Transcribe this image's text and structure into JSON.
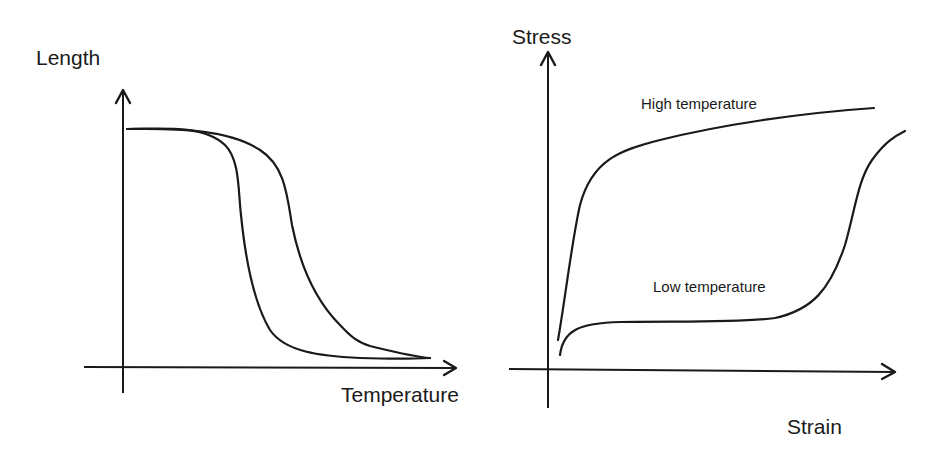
{
  "left_diagram": {
    "y_label": "Length",
    "x_label": "Temperature",
    "curves": [
      "cooling curve (inner)",
      "heating curve (outer)"
    ]
  },
  "right_diagram": {
    "y_label": "Stress",
    "x_label": "Strain",
    "curves": {
      "high": "High temperature",
      "low": "Low temperature"
    }
  },
  "colors": {
    "ink": "#1a1a1a",
    "background": "#ffffff"
  }
}
